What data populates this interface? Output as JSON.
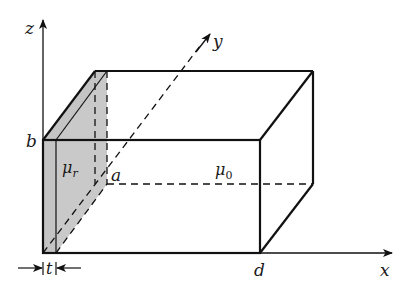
{
  "figure": {
    "type": "3d-box-with-magnetic-slab",
    "colors": {
      "line": "#111111",
      "slab_fill": "#c4c4c4",
      "background": "#ffffff"
    }
  },
  "axes": {
    "x": {
      "label": "x"
    },
    "y": {
      "label": "y"
    },
    "z": {
      "label": "z"
    }
  },
  "labels": {
    "a": "a",
    "b": "b",
    "d": "d",
    "t": "t",
    "mu_r": "μ",
    "mu_r_sub": "r",
    "mu_0": "μ",
    "mu_0_sub": "0"
  },
  "regions": [
    {
      "name": "slab",
      "permeability": "μr",
      "thickness": "t"
    },
    {
      "name": "air",
      "permeability": "μ0"
    }
  ],
  "dimensions": {
    "height": "b",
    "depth": "a",
    "length": "d",
    "slab_thickness": "t"
  }
}
